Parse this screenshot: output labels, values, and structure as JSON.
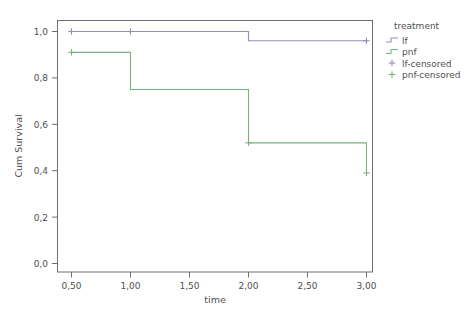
{
  "chart_data": {
    "type": "line",
    "title": "",
    "xlabel": "time",
    "ylabel": "Cum Survival",
    "xlim": [
      0.3,
      3.2
    ],
    "ylim": [
      0.0,
      1.05
    ],
    "grid": false,
    "legend_position": "right",
    "x_ticks": [
      "0,50",
      "1,00",
      "1,50",
      "2,00",
      "2,50",
      "3,00"
    ],
    "x_tick_values": [
      0.5,
      1.0,
      1.5,
      2.0,
      2.5,
      3.0
    ],
    "y_ticks": [
      "0,0",
      "0,2",
      "0,4",
      "0,6",
      "0,8",
      "1,0"
    ],
    "y_tick_values": [
      0.0,
      0.2,
      0.4,
      0.6,
      0.8,
      1.0
    ],
    "legend_title": "treatment",
    "series": [
      {
        "name": "lf",
        "color": "#8f90b8",
        "step_x": [
          0.5,
          1.0,
          2.0,
          2.0,
          3.0
        ],
        "step_y": [
          1.0,
          1.0,
          1.0,
          0.96,
          0.96
        ],
        "censored_x": [
          0.5,
          1.0,
          3.0
        ],
        "censored_y": [
          1.0,
          1.0,
          0.96
        ]
      },
      {
        "name": "pnf",
        "color": "#79b27f",
        "step_x": [
          0.5,
          1.0,
          1.0,
          2.0,
          2.0,
          3.0,
          3.0
        ],
        "step_y": [
          0.91,
          0.91,
          0.75,
          0.75,
          0.52,
          0.52,
          0.39
        ],
        "censored_x": [
          0.5,
          2.0,
          3.0
        ],
        "censored_y": [
          0.91,
          0.52,
          0.39
        ]
      }
    ],
    "legend_entries": [
      {
        "label": "lf",
        "color": "#8f90b8",
        "marker": "step-line"
      },
      {
        "label": "pnf",
        "color": "#79b27f",
        "marker": "step-line"
      },
      {
        "label": "lf-censored",
        "color": "#8f90b8",
        "marker": "plus"
      },
      {
        "label": "pnf-censored",
        "color": "#79b27f",
        "marker": "plus"
      }
    ]
  },
  "axes": {
    "x_label": "time",
    "y_label": "Cum Survival",
    "x_tick_labels": [
      "0,50",
      "1,00",
      "1,50",
      "2,00",
      "2,50",
      "3,00"
    ],
    "y_tick_labels": [
      "1,0",
      "0,8",
      "0,6",
      "0,4",
      "0,2",
      "0,0"
    ]
  },
  "legend": {
    "title": "treatment",
    "items": [
      {
        "label": "lf"
      },
      {
        "label": "pnf"
      },
      {
        "label": "lf-censored"
      },
      {
        "label": "pnf-censored"
      }
    ]
  },
  "colors": {
    "lf": "#8f90b8",
    "pnf": "#79b27f",
    "frame": "#6e6e6e",
    "text": "#4f4f4f",
    "background": "#ffffff"
  }
}
